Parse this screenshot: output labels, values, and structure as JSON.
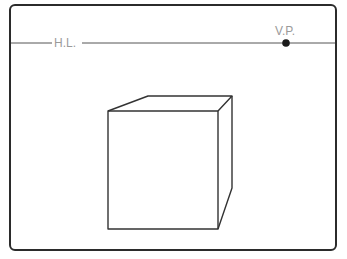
{
  "diagram": {
    "horizon_line": {
      "label": "H.L.",
      "y": 43
    },
    "vanishing_point": {
      "label": "V.P.",
      "x": 286,
      "y": 43
    },
    "colors": {
      "frame": "#2b2b2b",
      "line": "#555555",
      "label": "#9a9a9a",
      "cube": "#333333"
    },
    "cube": {
      "front": [
        [
          108,
          111
        ],
        [
          218,
          111
        ],
        [
          218,
          229
        ],
        [
          108,
          229
        ]
      ],
      "top_back": [
        [
          148,
          96
        ],
        [
          232,
          96
        ]
      ],
      "right_back_bottom": [
        232,
        188
      ]
    }
  }
}
